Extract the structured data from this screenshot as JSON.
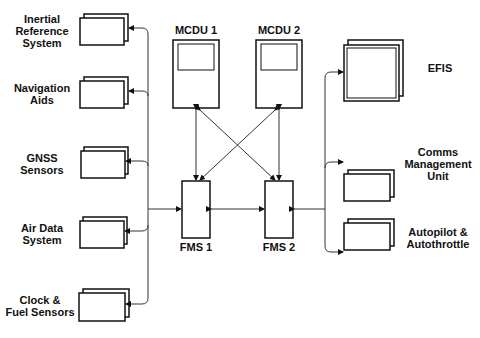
{
  "diagram": {
    "inputs": [
      {
        "id": "irs",
        "label": "Inertial\nReference\nSystem"
      },
      {
        "id": "nav",
        "label": "Navigation\nAids"
      },
      {
        "id": "gnss",
        "label": "GNSS\nSensors"
      },
      {
        "id": "adc",
        "label": "Air Data\nSystem"
      },
      {
        "id": "clock",
        "label": "Clock &\nFuel Sensors"
      }
    ],
    "mcdu": [
      {
        "label": "MCDU 1"
      },
      {
        "label": "MCDU 2"
      }
    ],
    "fms": [
      {
        "label": "FMS 1"
      },
      {
        "label": "FMS 2"
      }
    ],
    "outputs": [
      {
        "id": "efis",
        "label": "EFIS"
      },
      {
        "id": "cmu",
        "label": "Comms\nManagement\nUnit"
      },
      {
        "id": "ap",
        "label": "Autopilot &\nAutothrottle"
      }
    ]
  }
}
